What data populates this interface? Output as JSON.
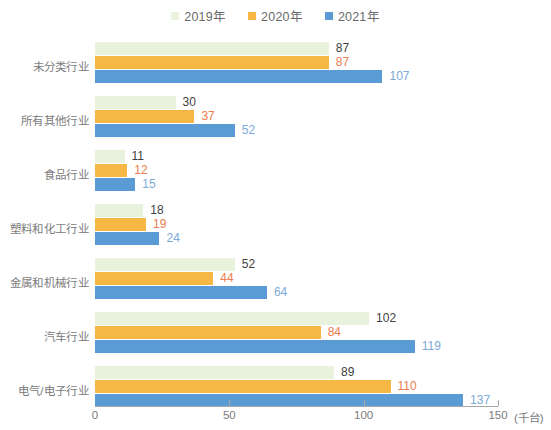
{
  "chart_data": {
    "type": "bar",
    "orientation": "horizontal",
    "title": "",
    "subtitle": "",
    "xlabel": "(千台)",
    "ylabel": "",
    "xlim": [
      0,
      150
    ],
    "xticks": [
      0,
      50,
      100,
      150
    ],
    "xtick_labels": [
      "0",
      "50",
      "100",
      "150"
    ],
    "grid": false,
    "legend_position": "top-center",
    "categories": [
      "未分类行业",
      "所有其他行业",
      "食品行业",
      "塑料和化工行业",
      "金属和机械行业",
      "汽车行业",
      "电气/电子行业"
    ],
    "series": [
      {
        "name": "2019年",
        "color": "#e9f2dc",
        "label_color": "#3f3f3f",
        "values": [
          87,
          30,
          11,
          18,
          52,
          102,
          89
        ]
      },
      {
        "name": "2020年",
        "color": "#f6b745",
        "label_color": "#ed7d4e",
        "values": [
          87,
          37,
          12,
          19,
          44,
          84,
          110
        ]
      },
      {
        "name": "2021年",
        "color": "#5b9bd5",
        "label_color": "#7ca9d8",
        "values": [
          107,
          52,
          15,
          24,
          64,
          119,
          137
        ]
      }
    ]
  },
  "axis": {
    "unit_label": "(千台)",
    "axis_color": "#a6a6a6",
    "tick_text_color": "#7b7b7b"
  },
  "legend": {
    "items": [
      {
        "label": "2019年",
        "color": "#e9f2dc"
      },
      {
        "label": "2020年",
        "color": "#f6b745"
      },
      {
        "label": "2021年",
        "color": "#5b9bd5"
      }
    ]
  }
}
